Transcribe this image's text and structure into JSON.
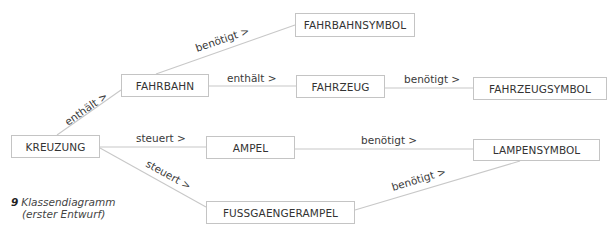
{
  "diagram": {
    "nodes": {
      "kreuzung": "KREUZUNG",
      "fahrbahn": "FAHRBAHN",
      "fahrbahnsymbol": "FAHRBAHNSYMBOL",
      "fahrzeug": "FAHRZEUG",
      "fahrzeugsymbol": "FAHRZEUGSYMBOL",
      "ampel": "AMPEL",
      "lampensymbol": "LAMPENSYMBOL",
      "fussgaengerampel": "FUSSGAENGERAMPEL"
    },
    "edges": [
      {
        "from": "KREUZUNG",
        "to": "FAHRBAHN",
        "label": "enthält >"
      },
      {
        "from": "FAHRBAHN",
        "to": "FAHRBAHNSYMBOL",
        "label": "benötigt >"
      },
      {
        "from": "FAHRBAHN",
        "to": "FAHRZEUG",
        "label": "enthält >"
      },
      {
        "from": "FAHRZEUG",
        "to": "FAHRZEUGSYMBOL",
        "label": "benötigt >"
      },
      {
        "from": "KREUZUNG",
        "to": "AMPEL",
        "label": "steuert >"
      },
      {
        "from": "AMPEL",
        "to": "LAMPENSYMBOL",
        "label": "benötigt >"
      },
      {
        "from": "KREUZUNG",
        "to": "FUSSGAENGERAMPEL",
        "label": "steuert >"
      },
      {
        "from": "FUSSGAENGERAMPEL",
        "to": "LAMPENSYMBOL",
        "label": "benötigt >"
      }
    ]
  },
  "caption": {
    "number": "9",
    "title": "Klassendiagramm",
    "subtitle": "(erster Entwurf)"
  },
  "colors": {
    "line": "#c8c8c8",
    "box_border": "#c4c4c4",
    "text": "#333333"
  }
}
